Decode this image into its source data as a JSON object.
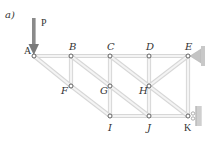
{
  "figure": {
    "panel_label": "a)",
    "load_label": "P",
    "colors": {
      "member": "#d7d7d7",
      "member_highlight": "#f4f4f4",
      "node_stroke": "#555555",
      "load_arrow": "#7a7a7a",
      "support": "#b8b8b8",
      "text": "#333333"
    }
  },
  "nodes": [
    {
      "id": "A",
      "label": "A",
      "x": 34,
      "y": 56
    },
    {
      "id": "B",
      "label": "B",
      "x": 71,
      "y": 56
    },
    {
      "id": "C",
      "label": "C",
      "x": 110,
      "y": 56
    },
    {
      "id": "D",
      "label": "D",
      "x": 149,
      "y": 56
    },
    {
      "id": "E",
      "label": "E",
      "x": 188,
      "y": 56
    },
    {
      "id": "F",
      "label": "F",
      "x": 71,
      "y": 86
    },
    {
      "id": "G",
      "label": "G",
      "x": 110,
      "y": 86
    },
    {
      "id": "H",
      "label": "H",
      "x": 149,
      "y": 86
    },
    {
      "id": "I",
      "label": "I",
      "x": 110,
      "y": 116
    },
    {
      "id": "J",
      "label": "J",
      "x": 149,
      "y": 116
    },
    {
      "id": "K",
      "label": "K",
      "x": 188,
      "y": 116
    }
  ],
  "members": [
    [
      "A",
      "B"
    ],
    [
      "B",
      "C"
    ],
    [
      "C",
      "D"
    ],
    [
      "D",
      "E"
    ],
    [
      "I",
      "J"
    ],
    [
      "J",
      "K"
    ],
    [
      "B",
      "F"
    ],
    [
      "C",
      "G"
    ],
    [
      "G",
      "I"
    ],
    [
      "D",
      "H"
    ],
    [
      "H",
      "J"
    ],
    [
      "E",
      "K"
    ],
    [
      "A",
      "F"
    ],
    [
      "F",
      "I"
    ],
    [
      "B",
      "G"
    ],
    [
      "G",
      "J"
    ],
    [
      "C",
      "H"
    ],
    [
      "H",
      "K"
    ],
    [
      "H",
      "E"
    ]
  ],
  "supports": [
    {
      "node": "E",
      "type": "pin"
    },
    {
      "node": "K",
      "type": "roller"
    }
  ],
  "loads": [
    {
      "node": "A",
      "label": "P",
      "direction": "down"
    }
  ]
}
